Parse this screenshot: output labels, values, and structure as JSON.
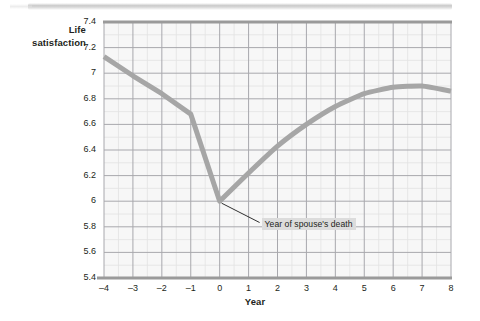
{
  "figure": {
    "scan_artifact": "top-page-edge-band"
  },
  "chart_data": {
    "type": "line",
    "title": "",
    "xlabel": "Year",
    "ylabel": "Life satisfaction",
    "ylabel_line1": "Life",
    "ylabel_line2": "satisfaction",
    "xlim": [
      -4,
      8
    ],
    "ylim": [
      5.4,
      7.4
    ],
    "xticks": [
      -4,
      -3,
      -2,
      -1,
      0,
      1,
      2,
      3,
      4,
      5,
      6,
      7,
      8
    ],
    "xticklabels": [
      "–4",
      "–3",
      "–2",
      "–1",
      "0",
      "1",
      "2",
      "3",
      "4",
      "5",
      "6",
      "7",
      "8"
    ],
    "yticks": [
      5.4,
      5.6,
      5.8,
      6.0,
      6.2,
      6.4,
      6.6,
      6.8,
      7.0,
      7.2,
      7.4
    ],
    "yticklabels": [
      "5.4",
      "5.6",
      "5.8",
      "6",
      "6.2",
      "6.4",
      "6.6",
      "6.8",
      "7",
      "7.2",
      "7.4"
    ],
    "grid": true,
    "minor_grid": true,
    "minor_grid_divisions": 2,
    "legend": null,
    "series": [
      {
        "name": "Life satisfaction",
        "color": "#a6a6a6",
        "linewidth": 5,
        "x": [
          -4,
          -3,
          -2,
          -1,
          0,
          1,
          2,
          3,
          4,
          5,
          6,
          7,
          8
        ],
        "values": [
          7.13,
          6.98,
          6.84,
          6.68,
          6.0,
          6.22,
          6.43,
          6.6,
          6.74,
          6.84,
          6.89,
          6.9,
          6.86
        ]
      }
    ],
    "annotations": [
      {
        "text": "Year of spouse's death",
        "point_x": 0,
        "point_y": 6.0,
        "label_x": 1.45,
        "label_y": 5.81
      }
    ]
  }
}
